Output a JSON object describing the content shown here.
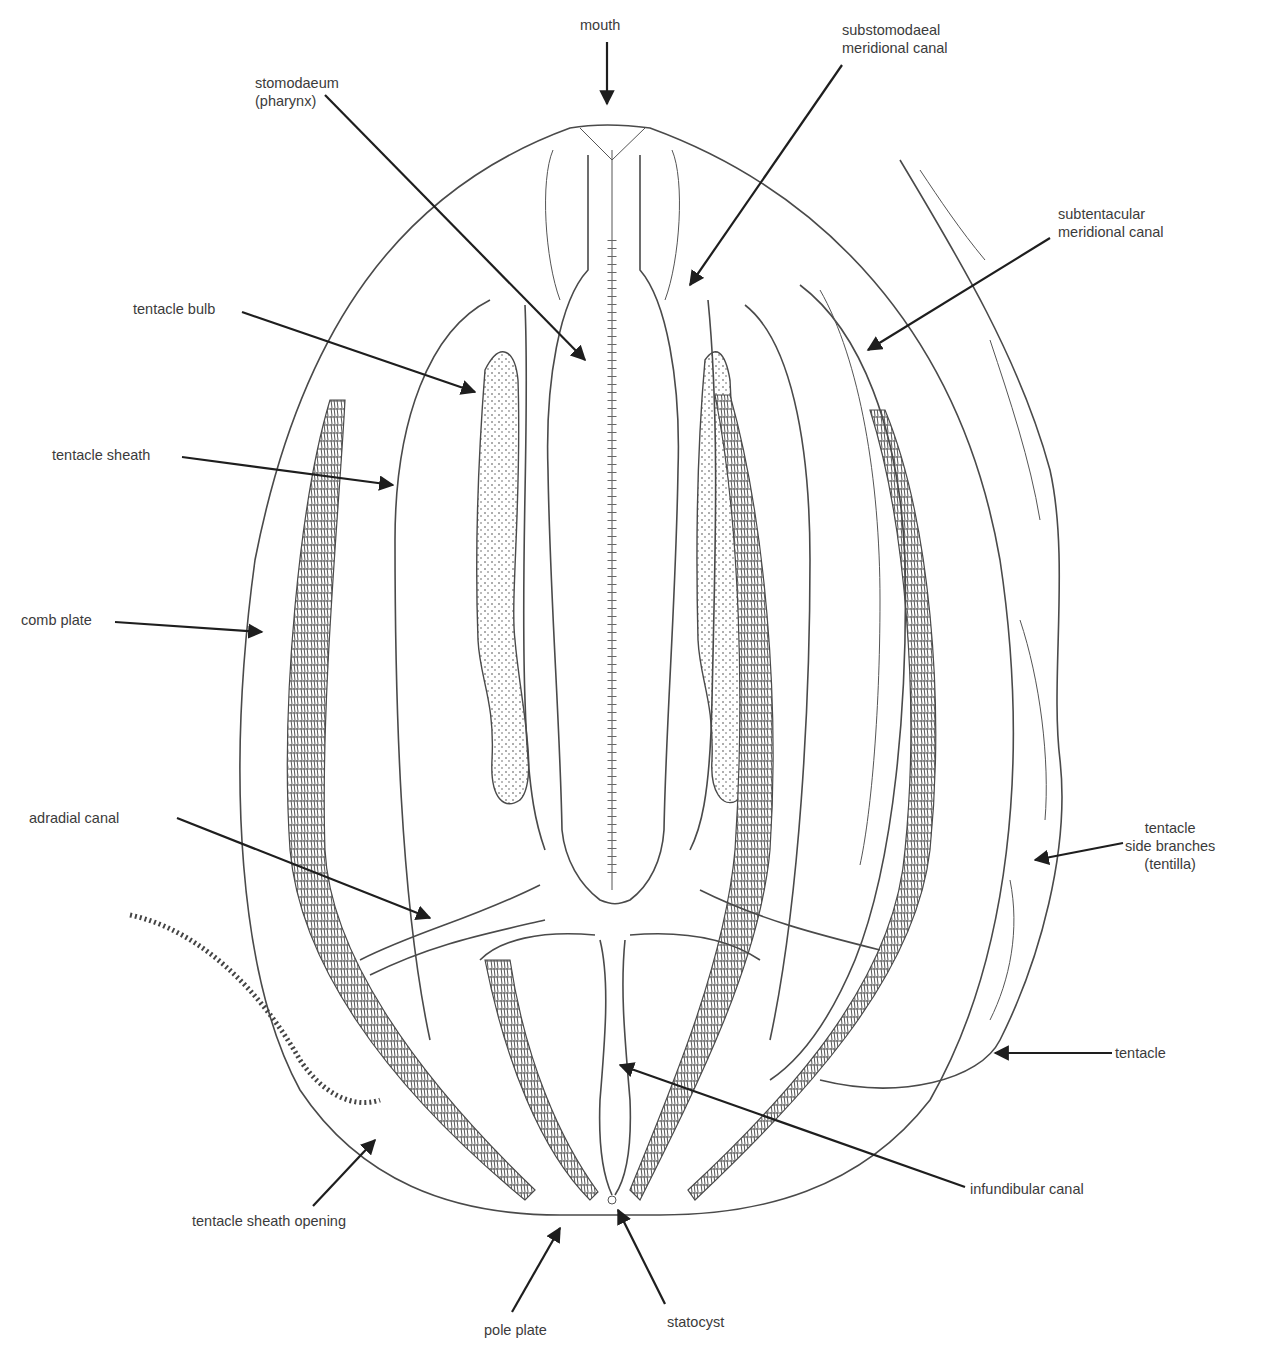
{
  "diagram": {
    "labels": {
      "mouth": "mouth",
      "substomodaeal": "substomodaeal\nmeridional canal",
      "stomodaeum": "stomodaeum\n(pharynx)",
      "subtentacular": "subtentacular\nmeridional canal",
      "tentacle_bulb": "tentacle bulb",
      "tentacle_sheath": "tentacle sheath",
      "comb_plate": "comb plate",
      "adradial_canal": "adradial canal",
      "tentilla": "tentacle\nside branches\n(tentilla)",
      "tentacle": "tentacle",
      "infundibular_canal": "infundibular canal",
      "tentacle_sheath_opening": "tentacle sheath opening",
      "pole_plate": "pole plate",
      "statocyst": "statocyst"
    },
    "colors": {
      "line": "#4a4a4a",
      "arrow": "#1e1e1e",
      "text": "#3b3b3b",
      "comb": "#5a5a5a",
      "background": "#ffffff"
    }
  }
}
